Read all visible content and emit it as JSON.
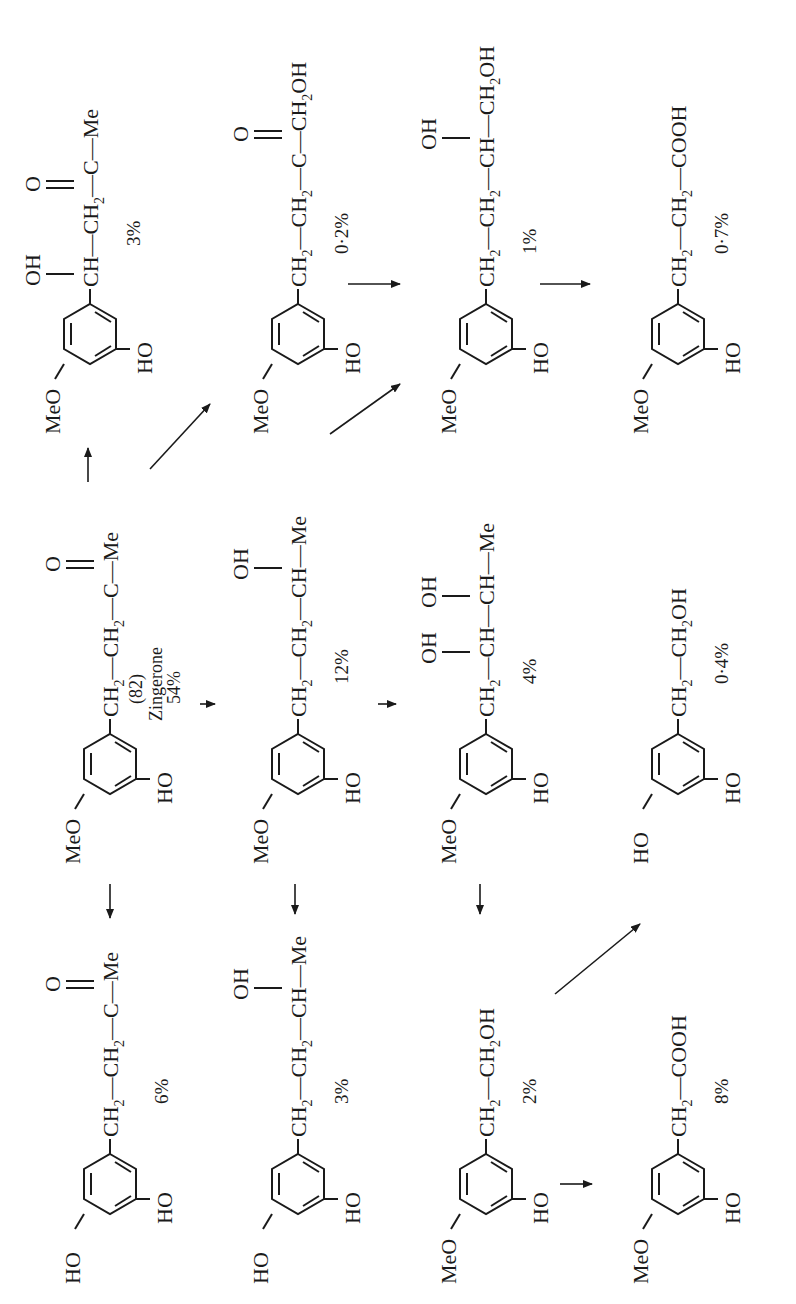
{
  "figure": {
    "compound_number": "(82)",
    "compound_name": "Zingerone",
    "compounds": [
      {
        "id": "zingerone",
        "ring": {
          "sub3": "MeO",
          "sub4": "HO"
        },
        "chain": "CH2-CH2-C(=O)-Me",
        "percent": "54%"
      },
      {
        "id": "catechol-butanone",
        "ring": {
          "sub3": "HO",
          "sub4": "HO"
        },
        "chain": "CH2-CH2-C(=O)-Me",
        "percent": "6%"
      },
      {
        "id": "hydroxy-zingerone",
        "ring": {
          "sub3": "MeO",
          "sub4": "HO"
        },
        "chain": "CH(OH)-CH2-C(=O)-Me",
        "percent": "3%"
      },
      {
        "id": "catechol-butanol",
        "ring": {
          "sub3": "HO",
          "sub4": "HO"
        },
        "chain": "CH2-CH2-CH(OH)-Me",
        "percent": "3%"
      },
      {
        "id": "zingerol",
        "ring": {
          "sub3": "MeO",
          "sub4": "HO"
        },
        "chain": "CH2-CH2-CH(OH)-Me",
        "percent": "12%"
      },
      {
        "id": "hydroxymethyl-ketone",
        "ring": {
          "sub3": "MeO",
          "sub4": "HO"
        },
        "chain": "CH2-CH2-C(=O)-CH2OH",
        "percent": "0·2%"
      },
      {
        "id": "homovanillyl-alcohol",
        "ring": {
          "sub3": "MeO",
          "sub4": "HO"
        },
        "chain": "CH2-CH2OH",
        "percent": "2%"
      },
      {
        "id": "butane-diol",
        "ring": {
          "sub3": "MeO",
          "sub4": "HO"
        },
        "chain": "CH2-CH(OH)-CH(OH)-Me",
        "percent": "4%"
      },
      {
        "id": "butane-diol-primary",
        "ring": {
          "sub3": "MeO",
          "sub4": "HO"
        },
        "chain": "CH2-CH2-CH(OH)-CH2OH",
        "percent": "1%"
      },
      {
        "id": "homovanillic-acid",
        "ring": {
          "sub3": "MeO",
          "sub4": "HO"
        },
        "chain": "CH2-COOH",
        "percent": "8%"
      },
      {
        "id": "dihydroxyphenylethanol",
        "ring": {
          "sub3": "HO",
          "sub4": "HO"
        },
        "chain": "CH2-CH2OH",
        "percent": "0·4%"
      },
      {
        "id": "dihydroferulic-acid",
        "ring": {
          "sub3": "MeO",
          "sub4": "HO"
        },
        "chain": "CH2-CH2-COOH",
        "percent": "0·7%"
      }
    ],
    "labels": {
      "MeO": "MeO",
      "HO": "HO",
      "OH": "OH",
      "O": "O",
      "CH": "CH",
      "C": "C",
      "Me": "Me",
      "COOH": "COOH",
      "dash": "—",
      "sub2": "2"
    },
    "percents": {
      "zingerone": "54%",
      "catechol_butanone": "6%",
      "hydroxy_zingerone": "3%",
      "catechol_butanol": "3%",
      "zingerol": "12%",
      "hydroxymethyl_ketone": "0·2%",
      "homovanillyl_alcohol": "2%",
      "butane_diol": "4%",
      "butane_diol_primary": "1%",
      "homovanillic_acid": "8%",
      "dihydroxyphenylethanol": "0·4%",
      "dihydroferulic_acid": "0·7%"
    },
    "arrows": [
      {
        "from": "zingerone",
        "to": "catechol-butanone"
      },
      {
        "from": "zingerone",
        "to": "hydroxy-zingerone"
      },
      {
        "from": "zingerone",
        "to": "zingerol"
      },
      {
        "from": "zingerone",
        "to": "hydroxymethyl-ketone"
      },
      {
        "from": "zingerol",
        "to": "catechol-butanol"
      },
      {
        "from": "zingerol",
        "to": "butane-diol"
      },
      {
        "from": "zingerol",
        "to": "butane-diol-primary"
      },
      {
        "from": "hydroxymethyl-ketone",
        "to": "butane-diol-primary"
      },
      {
        "from": "butane-diol-primary",
        "to": "dihydroferulic-acid"
      },
      {
        "from": "butane-diol",
        "to": "homovanillyl-alcohol"
      },
      {
        "from": "homovanillyl-alcohol",
        "to": "homovanillic-acid"
      },
      {
        "from": "homovanillyl-alcohol",
        "to": "dihydroxyphenylethanol"
      }
    ]
  }
}
